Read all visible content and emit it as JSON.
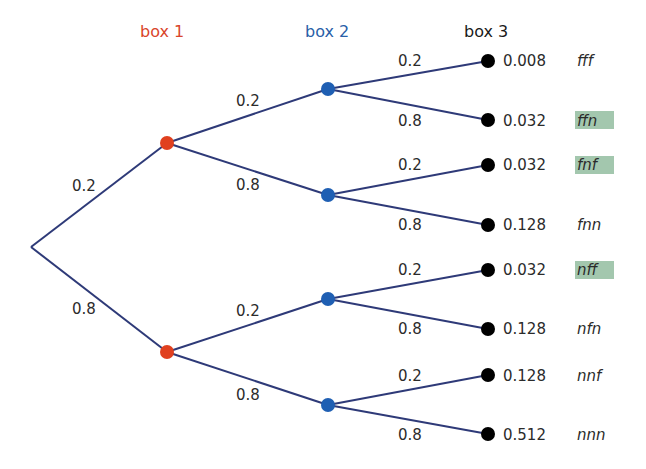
{
  "headers": [
    {
      "label": "box 1",
      "color": "#d9452b"
    },
    {
      "label": "box 2",
      "color": "#2a5fa8"
    },
    {
      "label": "box 3",
      "color": "#1a1a1a"
    }
  ],
  "colors": {
    "edge": "#2e3a78",
    "box1_node": "#e0401f",
    "box2_node": "#1f5fb3",
    "leaf_node": "#000000",
    "highlight": "#a3c7ae"
  },
  "root_edges": [
    {
      "prob": "0.2"
    },
    {
      "prob": "0.8"
    }
  ],
  "level2_edges": [
    {
      "prob": "0.2"
    },
    {
      "prob": "0.8"
    },
    {
      "prob": "0.2"
    },
    {
      "prob": "0.8"
    }
  ],
  "leaves": [
    {
      "edge_prob": "0.2",
      "probability": "0.008",
      "outcome": "fff",
      "highlighted": false
    },
    {
      "edge_prob": "0.8",
      "probability": "0.032",
      "outcome": "ffn",
      "highlighted": true
    },
    {
      "edge_prob": "0.2",
      "probability": "0.032",
      "outcome": "fnf",
      "highlighted": true
    },
    {
      "edge_prob": "0.8",
      "probability": "0.128",
      "outcome": "fnn",
      "highlighted": false
    },
    {
      "edge_prob": "0.2",
      "probability": "0.032",
      "outcome": "nff",
      "highlighted": true
    },
    {
      "edge_prob": "0.8",
      "probability": "0.128",
      "outcome": "nfn",
      "highlighted": false
    },
    {
      "edge_prob": "0.2",
      "probability": "0.128",
      "outcome": "nnf",
      "highlighted": false
    },
    {
      "edge_prob": "0.8",
      "probability": "0.512",
      "outcome": "nnn",
      "highlighted": false
    }
  ]
}
